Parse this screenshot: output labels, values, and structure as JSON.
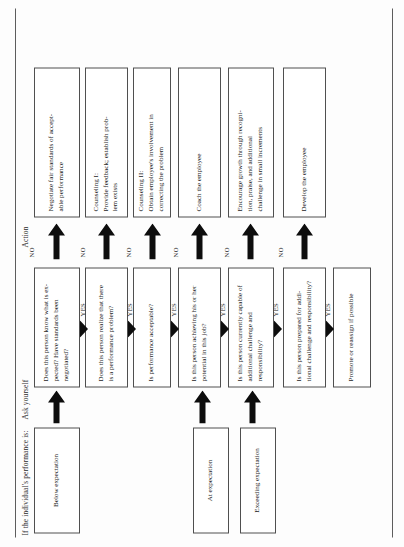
{
  "figure": {
    "columns": [
      {
        "id": "performance",
        "label": "If the individual's performance is:"
      },
      {
        "id": "ask",
        "label": "Ask yourself"
      },
      {
        "id": "action",
        "label": "Action"
      }
    ],
    "edge_labels": {
      "yes": "YES",
      "no": "NO"
    },
    "colors": {
      "page_background": "#fdfdfd",
      "box_border": "#4f4f4f",
      "rule": "#5d5d5d",
      "arrow": "#0d0d0d",
      "text": "#1c1c1c"
    },
    "performance_levels": [
      {
        "id": "below",
        "label": "Below expectation"
      },
      {
        "id": "at",
        "label": "At expectation"
      },
      {
        "id": "exceeding",
        "label": "Exceeding expectation"
      }
    ],
    "questions": [
      {
        "id": "q1",
        "lines": [
          "Does this person know what is ex-",
          "pected? Have standards been",
          "negotiated?"
        ]
      },
      {
        "id": "q2",
        "lines": [
          "Does this person realize that there",
          "is a performance problem?"
        ]
      },
      {
        "id": "q3",
        "lines": [
          "Is performance acceptable?"
        ]
      },
      {
        "id": "q4",
        "lines": [
          "Is this person achieving his or her",
          "potential in this job?"
        ]
      },
      {
        "id": "q5",
        "lines": [
          "Is this person currently capable of",
          "additional challenge and",
          "responsibility?"
        ]
      },
      {
        "id": "q6",
        "lines": [
          "Is this person prepared for addi-",
          "tional challenge and responsibility?"
        ]
      }
    ],
    "actions": [
      {
        "id": "a1",
        "lines": [
          "Negotiate fair standards of accept-",
          "able performance"
        ]
      },
      {
        "id": "a2",
        "lines": [
          "Counseling I:",
          "Provide feedback; establish prob-",
          "lem exists"
        ]
      },
      {
        "id": "a3",
        "lines": [
          "Counseling II:",
          "Obtain employee's involvement in",
          "correcting the problem"
        ]
      },
      {
        "id": "a4",
        "lines": [
          "Coach the employee"
        ]
      },
      {
        "id": "a5",
        "lines": [
          "Encourage growth through recogni-",
          "tion, praise, and additional",
          "challenge in small increments"
        ]
      },
      {
        "id": "a6",
        "lines": [
          "Develop the employee"
        ]
      }
    ],
    "terminal": {
      "id": "t1",
      "lines": [
        "Promote or reassign if possible"
      ]
    }
  }
}
